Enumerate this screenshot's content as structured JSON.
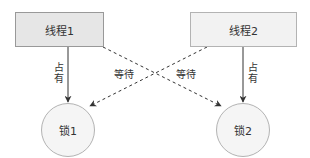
{
  "diagram": {
    "type": "deadlock-illustration",
    "colors": {
      "box_fill_1": "#e6e6e6",
      "box_fill_2": "#f2f2f2",
      "box_stroke": "#999999",
      "circle_fill": "#f5f5f5",
      "circle_stroke": "#b3b3b3",
      "edge_color": "#333333",
      "text_color": "#333333"
    },
    "nodes": {
      "thread1": {
        "label": "线程1",
        "shape": "rectangle",
        "x": 15,
        "y": 12,
        "w": 89,
        "h": 35
      },
      "thread2": {
        "label": "线程2",
        "shape": "rectangle",
        "x": 190,
        "y": 12,
        "w": 107,
        "h": 35
      },
      "lock1": {
        "label": "锁1",
        "shape": "circle",
        "cx": 68,
        "cy": 130,
        "r": 27
      },
      "lock2": {
        "label": "锁2",
        "shape": "circle",
        "cx": 243,
        "cy": 130,
        "r": 27
      }
    },
    "edges": [
      {
        "id": "t1-holds-l1",
        "from": "thread1",
        "to": "lock1",
        "style": "solid",
        "label": "占有"
      },
      {
        "id": "t2-holds-l2",
        "from": "thread2",
        "to": "lock2",
        "style": "solid",
        "label": "占有"
      },
      {
        "id": "t1-waits-l2",
        "from": "thread1",
        "to": "lock2",
        "style": "dashed",
        "label": "等待"
      },
      {
        "id": "t2-waits-l1",
        "from": "thread2",
        "to": "lock1",
        "style": "dashed",
        "label": "等待"
      }
    ],
    "labels": {
      "holds_left": "占有",
      "holds_right": "占有",
      "wait_left": "等待",
      "wait_right": "等待"
    }
  }
}
